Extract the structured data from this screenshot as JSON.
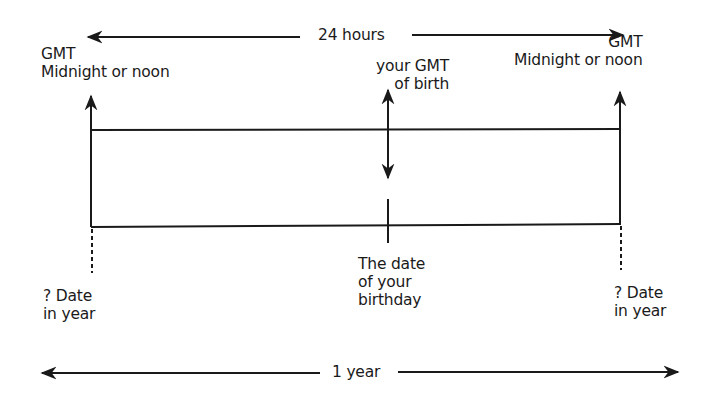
{
  "diagram": {
    "top_span": {
      "label": "24 hours"
    },
    "bottom_span": {
      "label": "1 year"
    },
    "left_marker": {
      "top_label": [
        "GMT",
        "Midnight or noon"
      ],
      "bottom_label": [
        "? Date",
        "in year"
      ]
    },
    "right_marker": {
      "top_label": [
        "GMT",
        "Midnight or noon"
      ],
      "bottom_label": [
        "? Date",
        "in year"
      ]
    },
    "center_marker": {
      "top_label": [
        "your GMT",
        "of birth"
      ],
      "bottom_label": [
        "The date",
        "of your",
        "birthday"
      ]
    },
    "colors": {
      "ink": "#1a1a1a",
      "background": "#ffffff"
    }
  }
}
